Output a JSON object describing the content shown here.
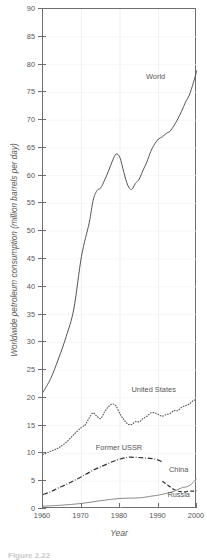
{
  "chart_data": {
    "type": "line",
    "title": "",
    "xlabel": "Year",
    "ylabel": "Worldwide petroleum consumption (million barrels per day)",
    "xlim": [
      1960,
      2000
    ],
    "ylim": [
      0,
      90
    ],
    "grid": true,
    "legend_position": "inline-annotations",
    "x_ticks": [
      1960,
      1970,
      1980,
      1990,
      2000
    ],
    "x_tick_labels": [
      "1960",
      "1970",
      "1980",
      "1990",
      "2000"
    ],
    "y_ticks": [
      0,
      5,
      10,
      15,
      20,
      25,
      30,
      35,
      40,
      45,
      50,
      55,
      60,
      65,
      70,
      75,
      80,
      85,
      90
    ],
    "y_tick_labels": [
      "0",
      "5",
      "10",
      "15",
      "20",
      "25",
      "30",
      "35",
      "40",
      "45",
      "50",
      "55",
      "60",
      "65",
      "70",
      "75",
      "80",
      "85",
      "90"
    ],
    "series": [
      {
        "name": "World",
        "style": "solid",
        "color": "#555555",
        "x": [
          1960,
          1962,
          1964,
          1966,
          1968,
          1970,
          1972,
          1973,
          1974,
          1975,
          1976,
          1977,
          1978,
          1979,
          1980,
          1981,
          1982,
          1983,
          1984,
          1985,
          1986,
          1987,
          1988,
          1989,
          1990,
          1991,
          1992,
          1993,
          1994,
          1995,
          1996,
          1997,
          1998,
          1999,
          2000
        ],
        "values": [
          21.0,
          23.5,
          27.0,
          31.0,
          36.0,
          45.5,
          51.5,
          55.5,
          57.3,
          57.8,
          59.2,
          60.8,
          62.6,
          63.9,
          63.2,
          60.6,
          58.3,
          57.5,
          58.6,
          59.4,
          61.0,
          62.5,
          64.4,
          65.7,
          66.6,
          67.0,
          67.6,
          68.0,
          69.0,
          70.2,
          71.6,
          73.2,
          74.5,
          76.6,
          79.0
        ]
      },
      {
        "name": "United States",
        "style": "dotted",
        "color": "#555555",
        "x": [
          1960,
          1962,
          1964,
          1966,
          1968,
          1970,
          1971,
          1972,
          1973,
          1974,
          1975,
          1976,
          1977,
          1978,
          1979,
          1980,
          1981,
          1982,
          1983,
          1984,
          1985,
          1986,
          1987,
          1988,
          1989,
          1990,
          1991,
          1992,
          1993,
          1994,
          1995,
          1996,
          1997,
          1998,
          1999,
          2000
        ],
        "values": [
          9.8,
          10.4,
          11.0,
          12.0,
          13.4,
          14.7,
          15.2,
          16.4,
          17.3,
          16.7,
          16.3,
          17.5,
          18.4,
          18.9,
          18.5,
          17.1,
          16.1,
          15.3,
          15.2,
          15.7,
          15.7,
          16.3,
          16.7,
          17.3,
          17.3,
          17.0,
          16.7,
          17.0,
          17.2,
          17.7,
          17.7,
          18.3,
          18.6,
          18.9,
          19.5,
          19.7
        ]
      },
      {
        "name": "Former USSR",
        "style": "dashdot",
        "color": "#333333",
        "x": [
          1960,
          1962,
          1964,
          1966,
          1968,
          1970,
          1972,
          1974,
          1976,
          1978,
          1980,
          1982,
          1984,
          1986,
          1988,
          1990,
          1991
        ],
        "values": [
          2.6,
          3.1,
          3.8,
          4.4,
          5.1,
          5.8,
          6.6,
          7.3,
          7.9,
          8.5,
          9.0,
          9.3,
          9.3,
          9.2,
          9.1,
          8.8,
          8.4
        ]
      },
      {
        "name": "Russia",
        "style": "dashed",
        "color": "#333333",
        "x": [
          1991,
          1992,
          1993,
          1994,
          1995,
          1996,
          1997,
          1998,
          1999,
          2000
        ],
        "values": [
          5.0,
          4.5,
          4.0,
          3.5,
          3.2,
          3.1,
          3.1,
          3.2,
          3.2,
          3.3
        ]
      },
      {
        "name": "China",
        "style": "solid",
        "color": "#8a8a8a",
        "x": [
          1960,
          1965,
          1970,
          1975,
          1980,
          1985,
          1988,
          1990,
          1992,
          1994,
          1996,
          1998,
          2000
        ],
        "values": [
          0.5,
          0.7,
          1.0,
          1.5,
          1.9,
          2.0,
          2.3,
          2.5,
          2.8,
          3.2,
          3.8,
          4.2,
          5.5
        ]
      }
    ],
    "annotations": [
      {
        "label": "World",
        "x": 1989.5,
        "y": 77.5
      },
      {
        "label": "United States",
        "x": 1989.0,
        "y": 21.3
      },
      {
        "label": "Former USSR",
        "x": 1980.0,
        "y": 10.8
      },
      {
        "label": "China",
        "x": 1995.5,
        "y": 6.8
      },
      {
        "label": "Russia",
        "x": 1995.5,
        "y": 2.4
      }
    ]
  },
  "caption": {
    "text": "Figure 2.22"
  }
}
